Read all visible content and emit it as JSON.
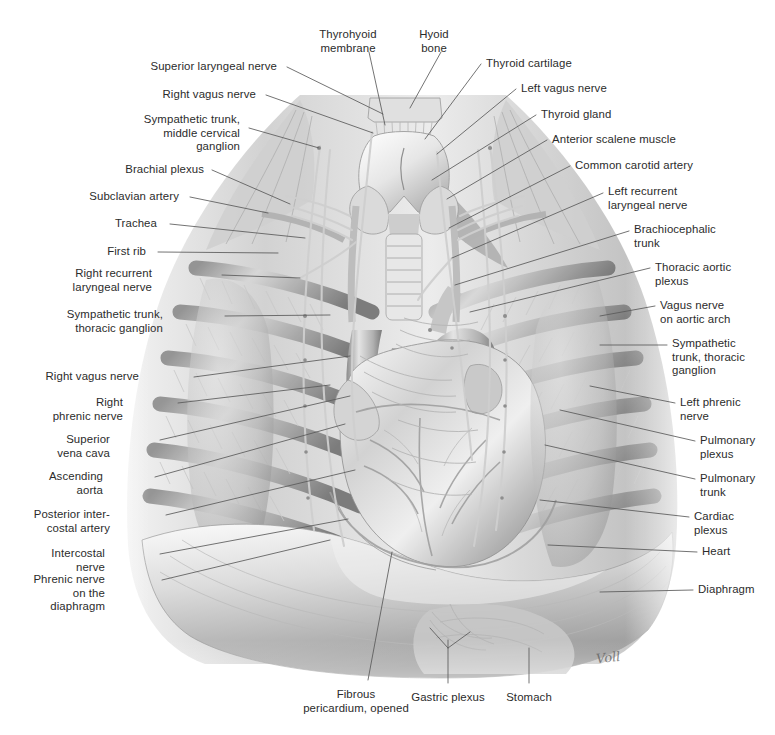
{
  "plate": {
    "title": "Autonomic nervous system of the thorax — anterior view",
    "signature": "Voll",
    "ink_color": "#2b2b2b",
    "leader_color": "#5a5a5a",
    "background": "#ffffff",
    "art_palette": [
      "#ffffff",
      "#efefef",
      "#d9d9d9",
      "#bdbdbd",
      "#9d9d9d",
      "#7c7c7c",
      "#5c5c5c",
      "#3e3e3e"
    ]
  },
  "labels": {
    "left": [
      {
        "id": "superior-laryngeal-nerve",
        "text": "Superior laryngeal nerve",
        "x": 277,
        "y": 60,
        "lines": 1
      },
      {
        "id": "right-vagus-nerve-neck",
        "text": "Right vagus nerve",
        "x": 256,
        "y": 88,
        "lines": 1
      },
      {
        "id": "sympathetic-trunk-mcg",
        "text": "Sympathetic trunk,\nmiddle cervical\nganglion",
        "x": 240,
        "y": 113,
        "lines": 3
      },
      {
        "id": "brachial-plexus",
        "text": "Brachial plexus",
        "x": 204,
        "y": 163,
        "lines": 1
      },
      {
        "id": "subclavian-artery",
        "text": "Subclavian artery",
        "x": 179,
        "y": 190,
        "lines": 1
      },
      {
        "id": "trachea",
        "text": "Trachea",
        "x": 157,
        "y": 217,
        "lines": 1
      },
      {
        "id": "first-rib",
        "text": "First rib",
        "x": 146,
        "y": 245,
        "lines": 1
      },
      {
        "id": "right-recurrent-laryngeal",
        "text": "Right recurrent\nlaryngeal nerve",
        "x": 152,
        "y": 267,
        "lines": 2
      },
      {
        "id": "sympathetic-trunk-tg-right",
        "text": "Sympathetic trunk,\nthoracic ganglion",
        "x": 163,
        "y": 308,
        "lines": 2
      },
      {
        "id": "right-vagus-nerve-thorax",
        "text": "Right vagus nerve",
        "x": 139,
        "y": 370,
        "lines": 1
      },
      {
        "id": "right-phrenic-nerve",
        "text": "Right\nphrenic nerve",
        "x": 123,
        "y": 396,
        "lines": 2
      },
      {
        "id": "superior-vena-cava",
        "text": "Superior\nvena cava",
        "x": 110,
        "y": 433,
        "lines": 2
      },
      {
        "id": "ascending-aorta",
        "text": "Ascending\naorta",
        "x": 103,
        "y": 470,
        "lines": 2
      },
      {
        "id": "posterior-intercostal-artery",
        "text": "Posterior inter-\ncostal artery",
        "x": 110,
        "y": 508,
        "lines": 2
      },
      {
        "id": "intercostal-nerve",
        "text": "Intercostal\nnerve",
        "x": 105,
        "y": 547,
        "lines": 2
      },
      {
        "id": "phrenic-nerve-diaphragm",
        "text": "Phrenic nerve\non the\ndiaphragm",
        "x": 105,
        "y": 573,
        "lines": 3
      }
    ],
    "top": [
      {
        "id": "thyrohyoid-membrane",
        "text": "Thyrohyoid\nmembrane",
        "x": 348,
        "y": 28,
        "lines": 2
      },
      {
        "id": "hyoid-bone",
        "text": "Hyoid\nbone",
        "x": 434,
        "y": 28,
        "lines": 2
      }
    ],
    "right": [
      {
        "id": "thyroid-cartilage",
        "text": "Thyroid cartilage",
        "x": 486,
        "y": 57,
        "lines": 1
      },
      {
        "id": "left-vagus-nerve",
        "text": "Left vagus nerve",
        "x": 521,
        "y": 82,
        "lines": 1
      },
      {
        "id": "thyroid-gland",
        "text": "Thyroid gland",
        "x": 541,
        "y": 108,
        "lines": 1
      },
      {
        "id": "anterior-scalene-muscle",
        "text": "Anterior scalene muscle",
        "x": 552,
        "y": 133,
        "lines": 1
      },
      {
        "id": "common-carotid-artery",
        "text": "Common carotid artery",
        "x": 575,
        "y": 159,
        "lines": 1
      },
      {
        "id": "left-recurrent-laryngeal",
        "text": "Left recurrent\nlaryngeal nerve",
        "x": 608,
        "y": 185,
        "lines": 2
      },
      {
        "id": "brachiocephalic-trunk",
        "text": "Brachiocephalic\ntrunk",
        "x": 634,
        "y": 223,
        "lines": 2
      },
      {
        "id": "thoracic-aortic-plexus",
        "text": "Thoracic aortic\nplexus",
        "x": 655,
        "y": 261,
        "lines": 2
      },
      {
        "id": "vagus-nerve-aortic-arch",
        "text": "Vagus nerve\non aortic arch",
        "x": 660,
        "y": 299,
        "lines": 2
      },
      {
        "id": "sympathetic-trunk-tg-left",
        "text": "Sympathetic\ntrunk, thoracic\nganglion",
        "x": 672,
        "y": 337,
        "lines": 3
      },
      {
        "id": "left-phrenic-nerve",
        "text": "Left phrenic\nnerve",
        "x": 680,
        "y": 396,
        "lines": 2
      },
      {
        "id": "pulmonary-plexus",
        "text": "Pulmonary\nplexus",
        "x": 700,
        "y": 434,
        "lines": 2
      },
      {
        "id": "pulmonary-trunk",
        "text": "Pulmonary\ntrunk",
        "x": 700,
        "y": 472,
        "lines": 2
      },
      {
        "id": "cardiac-plexus",
        "text": "Cardiac\nplexus",
        "x": 694,
        "y": 510,
        "lines": 2
      },
      {
        "id": "heart",
        "text": "Heart",
        "x": 702,
        "y": 545,
        "lines": 1
      },
      {
        "id": "diaphragm",
        "text": "Diaphragm",
        "x": 698,
        "y": 583,
        "lines": 1
      }
    ],
    "bottom": [
      {
        "id": "fibrous-pericardium",
        "text": "Fibrous\npericardium, opened",
        "x": 356,
        "y": 688,
        "lines": 2
      },
      {
        "id": "gastric-plexus",
        "text": "Gastric plexus",
        "x": 448,
        "y": 691,
        "lines": 1
      },
      {
        "id": "stomach",
        "text": "Stomach",
        "x": 529,
        "y": 691,
        "lines": 1
      }
    ]
  },
  "leaders": [
    {
      "id": "ld-superior-laryngeal-nerve",
      "path": "M287,67 L383,114"
    },
    {
      "id": "ld-right-vagus-nerve-neck",
      "path": "M266,95 L373,133"
    },
    {
      "id": "ld-sympathetic-trunk-mcg",
      "path": "M249,128 L319,148"
    },
    {
      "id": "ld-brachial-plexus",
      "path": "M212,170 L290,204"
    },
    {
      "id": "ld-subclavian-artery",
      "path": "M190,197 L268,213"
    },
    {
      "id": "ld-trachea",
      "path": "M170,224 L305,238"
    },
    {
      "id": "ld-first-rib",
      "path": "M158,252 L278,253"
    },
    {
      "id": "ld-right-recurrent-laryngeal",
      "path": "M222,275 L300,278"
    },
    {
      "id": "ld-sympathetic-trunk-tg-right",
      "path": "M225,316 L330,315"
    },
    {
      "id": "ld-right-vagus-nerve-thorax",
      "path": "M194,377 L350,356"
    },
    {
      "id": "ld-right-phrenic-nerve",
      "path": "M178,403 L330,385"
    },
    {
      "id": "ld-superior-vena-cava",
      "path": "M160,440 L350,396"
    },
    {
      "id": "ld-ascending-aorta",
      "path": "M155,477 L345,424"
    },
    {
      "id": "ld-posterior-intercostal-artery",
      "path": "M166,515 L355,470"
    },
    {
      "id": "ld-intercostal-nerve",
      "path": "M160,554 L348,519"
    },
    {
      "id": "ld-phrenic-nerve-diaphragm",
      "path": "M162,580 L330,540"
    },
    {
      "id": "ld-thyrohyoid-membrane",
      "path": "M369,52 L385,125"
    },
    {
      "id": "ld-hyoid-bone",
      "path": "M441,52 L410,108"
    },
    {
      "id": "ld-thyroid-cartilage",
      "path": "M481,64 L425,139"
    },
    {
      "id": "ld-left-vagus-nerve",
      "path": "M516,89 L437,154"
    },
    {
      "id": "ld-thyroid-gland",
      "path": "M536,115 L432,180"
    },
    {
      "id": "ld-anterior-scalene-muscle",
      "path": "M547,140 L447,199"
    },
    {
      "id": "ld-common-carotid-artery",
      "path": "M570,166 L449,228"
    },
    {
      "id": "ld-left-recurrent-laryngeal",
      "path": "M603,193 L452,258"
    },
    {
      "id": "ld-brachiocephalic-trunk",
      "path": "M629,231 L455,285"
    },
    {
      "id": "ld-thoracic-aortic-plexus",
      "path": "M650,268 L470,312"
    },
    {
      "id": "ld-vagus-nerve-aortic-arch",
      "path": "M655,306 L600,316"
    },
    {
      "id": "ld-sympathetic-trunk-tg-left",
      "path": "M667,345 L600,345"
    },
    {
      "id": "ld-left-phrenic-nerve",
      "path": "M675,403 L590,386"
    },
    {
      "id": "ld-pulmonary-plexus",
      "path": "M695,441 L560,410"
    },
    {
      "id": "ld-pulmonary-trunk",
      "path": "M695,479 L545,445"
    },
    {
      "id": "ld-cardiac-plexus",
      "path": "M689,517 L540,500"
    },
    {
      "id": "ld-heart",
      "path": "M697,552 L548,545"
    },
    {
      "id": "ld-diaphragm",
      "path": "M693,590 L600,592"
    },
    {
      "id": "ld-fibrous-pericardium",
      "path": "M368,680 L392,552"
    },
    {
      "id": "ld-gastric-plexus",
      "path": "M448,683 L448,640 M448,648 L430,628 M448,648 L470,632"
    },
    {
      "id": "ld-stomach",
      "path": "M529,683 L529,648"
    }
  ]
}
